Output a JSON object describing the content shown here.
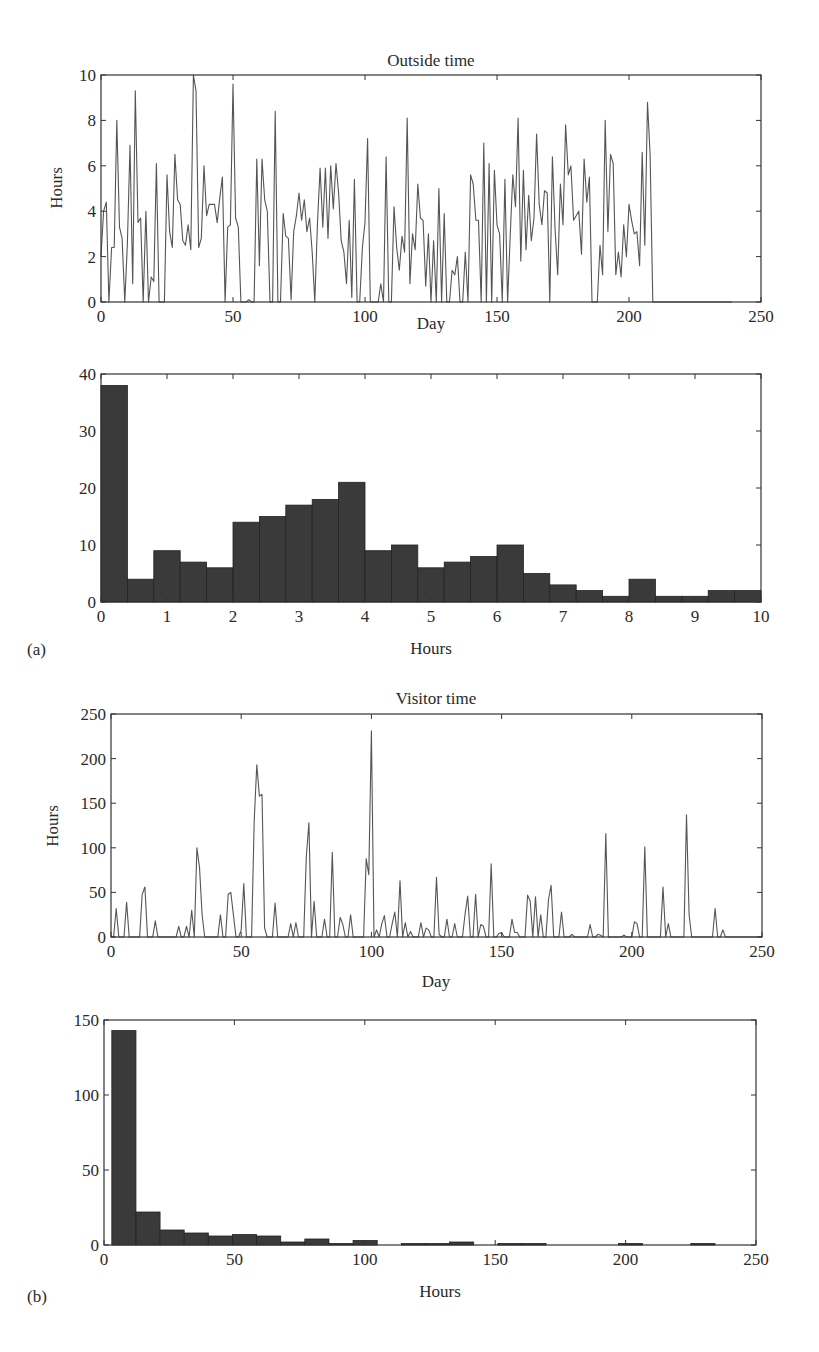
{
  "panels": {
    "a": "(a)",
    "b": "(b)"
  },
  "chart_data": [
    {
      "id": "outside-series",
      "type": "line",
      "title": "Outside time",
      "xlabel": "Day",
      "ylabel": "Hours",
      "xlim": [
        0,
        250
      ],
      "ylim": [
        0,
        10
      ],
      "xticks": [
        0,
        50,
        100,
        150,
        200,
        250
      ],
      "yticks": [
        0,
        2,
        4,
        6,
        8,
        10
      ],
      "grid": false,
      "line_color": "#555555",
      "frame": {
        "x": 101,
        "y": 75,
        "w": 660,
        "h": 227
      },
      "x": [
        0,
        1,
        2,
        3,
        4,
        5,
        6,
        7,
        8,
        9,
        10,
        11,
        12,
        13,
        14,
        15,
        16,
        17,
        18,
        19,
        20,
        21,
        22,
        23,
        24,
        25,
        26,
        27,
        28,
        29,
        30,
        31,
        32,
        33,
        34,
        35,
        36,
        37,
        38,
        39,
        40,
        41,
        42,
        43,
        44,
        45,
        46,
        47,
        48,
        49,
        50,
        51,
        52,
        53,
        54,
        55,
        56,
        57,
        58,
        59,
        60,
        61,
        62,
        63,
        64,
        65,
        66,
        67,
        68,
        69,
        70,
        71,
        72,
        73,
        74,
        75,
        76,
        77,
        78,
        79,
        80,
        81,
        82,
        83,
        84,
        85,
        86,
        87,
        88,
        89,
        90,
        91,
        92,
        93,
        94,
        95,
        96,
        97,
        98,
        99,
        100,
        101,
        102,
        103,
        104,
        105,
        106,
        107,
        108,
        109,
        110,
        111,
        112,
        113,
        114,
        115,
        116,
        117,
        118,
        119,
        120,
        121,
        122,
        123,
        124,
        125,
        126,
        127,
        128,
        129,
        130,
        131,
        132,
        133,
        134,
        135,
        136,
        137,
        138,
        139,
        140,
        141,
        142,
        143,
        144,
        145,
        146,
        147,
        148,
        149,
        150,
        151,
        152,
        153,
        154,
        155,
        156,
        157,
        158,
        159,
        160,
        161,
        162,
        163,
        164,
        165,
        166,
        167,
        168,
        169,
        170,
        171,
        172,
        173,
        174,
        175,
        176,
        177,
        178,
        179,
        180,
        181,
        182,
        183,
        184,
        185,
        186,
        187,
        188,
        189,
        190,
        191,
        192,
        193,
        194,
        195,
        196,
        197,
        198,
        199,
        200,
        201,
        202,
        203,
        204,
        205,
        206,
        207,
        208,
        209,
        210,
        211,
        212,
        213,
        214,
        215,
        216,
        217,
        218,
        219,
        220,
        221,
        222,
        223,
        224,
        225,
        226,
        227,
        228,
        229,
        230,
        231,
        232,
        233,
        234,
        235,
        236,
        237,
        238,
        239,
        240,
        241,
        242,
        243,
        244,
        245,
        246,
        247,
        248,
        249,
        250
      ],
      "values": [
        2.0,
        4.0,
        4.4,
        0.0,
        2.4,
        2.4,
        8.0,
        3.3,
        2.8,
        0.0,
        2.6,
        6.9,
        0.8,
        9.3,
        3.5,
        3.7,
        0.0,
        4.0,
        0.0,
        1.1,
        0.9,
        6.1,
        0.0,
        0.0,
        0.0,
        5.6,
        3.1,
        2.4,
        6.5,
        4.5,
        4.3,
        2.7,
        2.5,
        3.4,
        2.3,
        10.0,
        9.3,
        2.4,
        2.8,
        6.0,
        3.8,
        4.3,
        4.3,
        4.3,
        3.5,
        4.6,
        5.5,
        0.0,
        3.3,
        3.4,
        9.6,
        3.7,
        3.3,
        0.0,
        0.0,
        0.0,
        0.1,
        0.0,
        0.0,
        6.3,
        1.6,
        6.3,
        4.5,
        4.0,
        0.0,
        0.0,
        8.4,
        0.0,
        0.0,
        3.9,
        2.9,
        2.8,
        0.1,
        3.1,
        3.8,
        4.8,
        3.6,
        4.5,
        3.1,
        3.7,
        2.2,
        0.0,
        3.5,
        5.9,
        3.3,
        5.9,
        2.8,
        6.0,
        4.1,
        6.1,
        4.8,
        2.7,
        2.2,
        0.8,
        3.6,
        0.2,
        5.4,
        0.0,
        0.0,
        2.4,
        3.5,
        7.2,
        0.0,
        0.0,
        0.0,
        0.0,
        0.8,
        0.0,
        6.4,
        0.0,
        0.0,
        4.2,
        2.4,
        1.4,
        2.9,
        2.2,
        8.1,
        0.8,
        3.0,
        2.3,
        5.2,
        3.7,
        3.6,
        0.7,
        3.0,
        0.0,
        2.7,
        0.0,
        5.0,
        0.0,
        3.9,
        0.0,
        0.0,
        1.4,
        1.2,
        2.0,
        0.0,
        0.0,
        2.2,
        0.0,
        5.6,
        5.2,
        3.6,
        3.6,
        0.0,
        7.0,
        0.0,
        6.1,
        0.0,
        5.8,
        3.4,
        3.0,
        0.0,
        5.4,
        0.0,
        2.9,
        5.6,
        4.2,
        8.1,
        1.8,
        5.8,
        2.3,
        4.7,
        2.7,
        3.7,
        7.4,
        4.3,
        3.4,
        4.9,
        4.8,
        0.0,
        6.4,
        3.2,
        1.2,
        5.2,
        3.4,
        7.8,
        5.6,
        6.0,
        3.6,
        3.8,
        4.0,
        2.1,
        6.3,
        4.4,
        5.5,
        0.0,
        0.0,
        0.0,
        2.5,
        1.2,
        8.0,
        3.1,
        6.5,
        6.1,
        1.2,
        2.2,
        1.1,
        3.4,
        2.0,
        4.3,
        3.6,
        3.0,
        3.1,
        1.6,
        6.6,
        2.5,
        8.8,
        6.5,
        0.0,
        0.0,
        0.0,
        0.0,
        0.0,
        0.0,
        0.0,
        0.0,
        0.0,
        0.0,
        0.0,
        0.0,
        0.0,
        0.0,
        0.0,
        0.0,
        0.0,
        0.0,
        0.0,
        0.0,
        0.0,
        0.0,
        0.0,
        0.0,
        0.0,
        0.0,
        0.0,
        0.0,
        0.0,
        0.0,
        0.0
      ]
    },
    {
      "id": "outside-hist",
      "type": "bar",
      "title": "",
      "xlabel": "Hours",
      "ylabel": "",
      "xlim": [
        0,
        10
      ],
      "ylim": [
        0,
        40
      ],
      "xticks": [
        0,
        1,
        2,
        3,
        4,
        5,
        6,
        7,
        8,
        9,
        10
      ],
      "yticks": [
        0,
        10,
        20,
        30,
        40
      ],
      "bin_width": 0.4,
      "bar_color": "#3a3a3a",
      "frame": {
        "x": 101,
        "y": 374,
        "w": 660,
        "h": 228
      },
      "categories": [
        0.0,
        0.4,
        0.8,
        1.2,
        1.6,
        2.0,
        2.4,
        2.8,
        3.2,
        3.6,
        4.0,
        4.4,
        4.8,
        5.2,
        5.6,
        6.0,
        6.4,
        6.8,
        7.2,
        7.6,
        8.0,
        8.4,
        8.8,
        9.2,
        9.6
      ],
      "values": [
        38,
        4,
        9,
        7,
        6,
        14,
        15,
        17,
        18,
        21,
        9,
        10,
        6,
        7,
        8,
        10,
        5,
        3,
        2,
        1,
        4,
        1,
        1,
        2,
        2
      ]
    },
    {
      "id": "visitor-series",
      "type": "line",
      "title": "Visitor time",
      "xlabel": "Day",
      "ylabel": "Hours",
      "xlim": [
        0,
        250
      ],
      "ylim": [
        0,
        250
      ],
      "xticks": [
        0,
        50,
        100,
        150,
        200,
        250
      ],
      "yticks": [
        0,
        50,
        100,
        150,
        200,
        250
      ],
      "grid": false,
      "line_color": "#555555",
      "frame": {
        "x": 111,
        "y": 714,
        "w": 651,
        "h": 223
      },
      "x": [
        0,
        1,
        2,
        3,
        4,
        5,
        6,
        7,
        8,
        9,
        10,
        11,
        12,
        13,
        14,
        15,
        16,
        17,
        18,
        19,
        20,
        21,
        22,
        23,
        24,
        25,
        26,
        27,
        28,
        29,
        30,
        31,
        32,
        33,
        34,
        35,
        36,
        37,
        38,
        39,
        40,
        41,
        42,
        43,
        44,
        45,
        46,
        47,
        48,
        49,
        50,
        51,
        52,
        53,
        54,
        55,
        56,
        57,
        58,
        59,
        60,
        61,
        62,
        63,
        64,
        65,
        66,
        67,
        68,
        69,
        70,
        71,
        72,
        73,
        74,
        75,
        76,
        77,
        78,
        79,
        80,
        81,
        82,
        83,
        84,
        85,
        86,
        87,
        88,
        89,
        90,
        91,
        92,
        93,
        94,
        95,
        96,
        97,
        98,
        99,
        100,
        101,
        102,
        103,
        104,
        105,
        106,
        107,
        108,
        109,
        110,
        111,
        112,
        113,
        114,
        115,
        116,
        117,
        118,
        119,
        120,
        121,
        122,
        123,
        124,
        125,
        126,
        127,
        128,
        129,
        130,
        131,
        132,
        133,
        134,
        135,
        136,
        137,
        138,
        139,
        140,
        141,
        142,
        143,
        144,
        145,
        146,
        147,
        148,
        149,
        150,
        151,
        152,
        153,
        154,
        155,
        156,
        157,
        158,
        159,
        160,
        161,
        162,
        163,
        164,
        165,
        166,
        167,
        168,
        169,
        170,
        171,
        172,
        173,
        174,
        175,
        176,
        177,
        178,
        179,
        180,
        181,
        182,
        183,
        184,
        185,
        186,
        187,
        188,
        189,
        190,
        191,
        192,
        193,
        194,
        195,
        196,
        197,
        198,
        199,
        200,
        201,
        202,
        203,
        204,
        205,
        206,
        207,
        208,
        209,
        210,
        211,
        212,
        213,
        214,
        215,
        216,
        217,
        218,
        219,
        220,
        221,
        222,
        223,
        224,
        225,
        226,
        227,
        228,
        229,
        230,
        231,
        232,
        233,
        234,
        235,
        236,
        237,
        238,
        239,
        240,
        241,
        242,
        243,
        244,
        245,
        246,
        247,
        248,
        249,
        250
      ],
      "values": [
        0,
        0,
        32,
        0,
        0,
        0,
        39,
        0,
        0,
        0,
        0,
        0,
        48,
        56,
        0,
        0,
        0,
        18,
        0,
        0,
        0,
        0,
        0,
        0,
        0,
        0,
        12,
        0,
        0,
        12,
        0,
        30,
        0,
        100,
        78,
        25,
        0,
        0,
        0,
        0,
        0,
        0,
        25,
        0,
        0,
        48,
        50,
        25,
        0,
        0,
        8,
        60,
        0,
        0,
        0,
        130,
        193,
        158,
        160,
        10,
        0,
        0,
        0,
        38,
        0,
        0,
        0,
        0,
        0,
        15,
        0,
        16,
        0,
        0,
        0,
        90,
        128,
        0,
        40,
        0,
        0,
        0,
        20,
        0,
        0,
        95,
        0,
        0,
        22,
        14,
        0,
        0,
        25,
        0,
        0,
        0,
        0,
        0,
        88,
        70,
        231,
        0,
        8,
        0,
        15,
        24,
        0,
        0,
        15,
        28,
        0,
        63,
        0,
        16,
        0,
        6,
        0,
        0,
        0,
        16,
        0,
        10,
        8,
        0,
        0,
        67,
        3,
        0,
        0,
        20,
        0,
        0,
        15,
        0,
        0,
        0,
        26,
        46,
        0,
        0,
        48,
        0,
        14,
        12,
        0,
        0,
        82,
        0,
        0,
        4,
        5,
        0,
        0,
        0,
        20,
        5,
        5,
        0,
        0,
        0,
        47,
        40,
        0,
        45,
        0,
        25,
        0,
        0,
        42,
        58,
        0,
        0,
        0,
        28,
        0,
        0,
        0,
        3,
        0,
        0,
        0,
        0,
        0,
        0,
        14,
        0,
        0,
        3,
        2,
        0,
        116,
        0,
        0,
        0,
        0,
        0,
        0,
        2,
        0,
        0,
        0,
        17,
        15,
        0,
        0,
        101,
        0,
        0,
        0,
        0,
        0,
        0,
        56,
        0,
        15,
        0,
        0,
        0,
        0,
        0,
        0,
        137,
        25,
        0,
        0,
        0,
        0,
        0,
        0,
        0,
        0,
        0,
        32,
        0,
        0,
        8,
        0,
        0,
        0,
        0,
        0,
        0,
        0,
        0,
        0,
        0,
        0,
        0,
        0,
        0,
        0,
        0,
        0,
        0,
        0,
        0,
        0,
        0,
        0,
        0,
        0
      ]
    },
    {
      "id": "visitor-hist",
      "type": "bar",
      "title": "",
      "xlabel": "Hours",
      "ylabel": "",
      "xlim": [
        0,
        250
      ],
      "ylim": [
        0,
        150
      ],
      "xticks": [
        0,
        50,
        100,
        150,
        200,
        250
      ],
      "yticks": [
        0,
        50,
        100,
        150
      ],
      "bin_width": 9.25,
      "bar_color": "#3a3a3a",
      "frame": {
        "x": 104,
        "y": 1020,
        "w": 652,
        "h": 225
      },
      "categories": [
        3.0,
        12.25,
        21.5,
        30.75,
        40.0,
        49.25,
        58.5,
        67.75,
        77.0,
        86.25,
        95.5,
        104.75,
        114.0,
        123.25,
        132.5,
        141.75,
        151.0,
        160.25,
        169.5,
        178.75,
        188.0,
        197.25,
        206.5,
        215.75,
        225.0
      ],
      "values": [
        143,
        22,
        10,
        8,
        6,
        7,
        6,
        2,
        4,
        1,
        3,
        0,
        1,
        1,
        2,
        0,
        1,
        1,
        0,
        0,
        0,
        1,
        0,
        0,
        1
      ]
    }
  ]
}
